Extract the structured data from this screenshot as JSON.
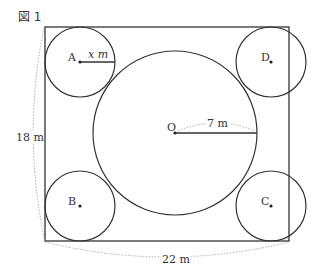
{
  "figure": {
    "title": "図 1",
    "points": {
      "A": "A",
      "B": "B",
      "C": "C",
      "D": "D",
      "O": "O"
    },
    "labels": {
      "radius_small": "x m",
      "radius_large": "7 m",
      "height": "18 m",
      "width": "22 m"
    },
    "dimensions": {
      "rect_width_m": 22,
      "rect_height_m": 18,
      "large_circle_radius_m": 7,
      "small_circle_radius": "x"
    },
    "colors": {
      "stroke": "#333333",
      "dotted": "#999999"
    }
  }
}
